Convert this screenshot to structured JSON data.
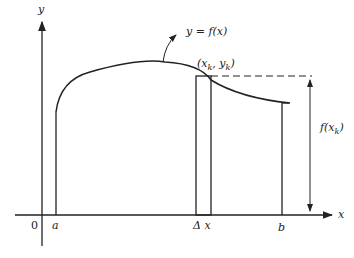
{
  "diagram": {
    "labels": {
      "y_axis": "y",
      "x_axis": "x",
      "origin": "0",
      "a": "a",
      "b": "b",
      "delta_x": "Δ x",
      "curve": "y = f(x)",
      "point_x": "(x",
      "point_sub1": "k",
      "point_mid": ", y",
      "point_sub2": "k",
      "point_end": ")",
      "height_f": "f(x",
      "height_sub": "k",
      "height_end": ")"
    },
    "colors": {
      "stroke": "#222222",
      "background": "#ffffff"
    }
  }
}
